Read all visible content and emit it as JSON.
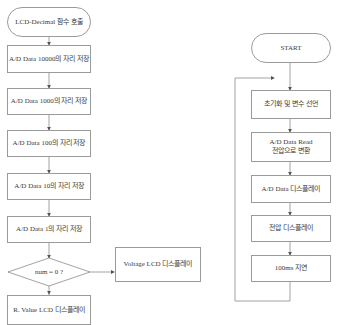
{
  "left_flow": {
    "start": "LCD-Decimal 함수 호출",
    "steps": [
      "A/D Data 10000의 자리 저장",
      "A/D Data 1000의 자리 저장",
      "A/D Data 100의 자리 저장",
      "A/D Data 10의 자리 저장",
      "A/D Data 1의 자리 저장"
    ],
    "decision": "num = 0 ?",
    "yes_branch": "Voltage LCD 디스플레이",
    "no_branch": "R. Value LCD 디스플레이"
  },
  "right_flow": {
    "start": "START",
    "steps": [
      "초기화 및 변수 선언",
      "A/D Data Read",
      "전압으로 변환",
      "A/D Data 디스플레이",
      "전압 디스플레이",
      "100ms 지연"
    ]
  },
  "colors": {
    "line": "#9a9a9a",
    "text": "#3a3a3a",
    "background": "#ffffff"
  }
}
